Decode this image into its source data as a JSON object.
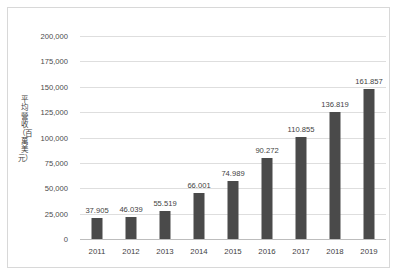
{
  "chart_data": {
    "type": "bar",
    "title": "",
    "xlabel": "",
    "ylabel": "平均營收（百萬美元）",
    "categories": [
      "2011",
      "2012",
      "2013",
      "2014",
      "2015",
      "2016",
      "2017",
      "2018",
      "2019"
    ],
    "values": [
      37.905,
      46.039,
      55.519,
      66.001,
      74.989,
      90.272,
      110.855,
      136.819,
      161.857
    ],
    "data_labels": [
      "37.905",
      "46.039",
      "55.519",
      "66.001",
      "74.989",
      "90.272",
      "110.855",
      "136.819",
      "161.857"
    ],
    "plotted_heights": [
      21000,
      21500,
      28000,
      45500,
      57500,
      79500,
      100500,
      125500,
      148000
    ],
    "ylim": [
      0,
      200000
    ],
    "ytick_values": [
      0,
      25000,
      50000,
      75000,
      100000,
      125000,
      150000,
      175000,
      200000
    ],
    "ytick_labels": [
      "0",
      "25,000",
      "50,000",
      "75,000",
      "100,000",
      "125,000",
      "150,000",
      "175,000",
      "200,000"
    ],
    "grid": true,
    "legend": "none",
    "series_color": "#4a4a4a",
    "gridline_color": "#dedede",
    "background_color": "#ffffff",
    "border_color": "#d8d8d8"
  }
}
